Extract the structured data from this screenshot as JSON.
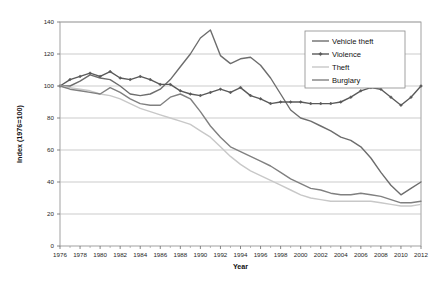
{
  "chart_data": {
    "type": "line",
    "title": "",
    "xlabel": "Year",
    "ylabel": "Index (1976=100)",
    "xlim": [
      1976,
      2012
    ],
    "ylim": [
      0,
      140
    ],
    "ytick_step": 20,
    "xtick_step": 2,
    "grid": true,
    "legend_position": "top-right",
    "yticks": [
      0,
      20,
      40,
      60,
      80,
      100,
      120,
      140
    ],
    "xticks": [
      1976,
      1978,
      1980,
      1982,
      1984,
      1986,
      1988,
      1990,
      1992,
      1994,
      1996,
      1998,
      2000,
      2002,
      2004,
      2006,
      2008,
      2010,
      2012
    ],
    "x": [
      1976,
      1977,
      1978,
      1979,
      1980,
      1981,
      1982,
      1983,
      1984,
      1985,
      1986,
      1987,
      1988,
      1989,
      1990,
      1991,
      1992,
      1993,
      1994,
      1995,
      1996,
      1997,
      1998,
      1999,
      2000,
      2001,
      2002,
      2003,
      2004,
      2005,
      2006,
      2007,
      2008,
      2009,
      2010,
      2011,
      2012
    ],
    "series": [
      {
        "name": "Vehicle theft",
        "color": "#6d6d6d",
        "marker": "none",
        "values": [
          100,
          100,
          103,
          107,
          105,
          104,
          100,
          95,
          94,
          95,
          98,
          104,
          112,
          120,
          130,
          135,
          119,
          114,
          117,
          118,
          113,
          105,
          95,
          85,
          80,
          78,
          75,
          72,
          68,
          66,
          62,
          55,
          46,
          38,
          32,
          36,
          40
        ]
      },
      {
        "name": "Violence",
        "color": "#5a5a5a",
        "marker": "diamond",
        "values": [
          100,
          104,
          106,
          108,
          106,
          109,
          105,
          104,
          106,
          104,
          101,
          101,
          97,
          95,
          94,
          96,
          98,
          96,
          99,
          94,
          92,
          89,
          90,
          90,
          90,
          89,
          89,
          89,
          90,
          93,
          97,
          99,
          98,
          93,
          88,
          93,
          100
        ]
      },
      {
        "name": "Theft",
        "color": "#c8c8c8",
        "marker": "none",
        "values": [
          100,
          99,
          98,
          97,
          95,
          94,
          92,
          89,
          86,
          84,
          82,
          80,
          78,
          76,
          72,
          68,
          62,
          56,
          51,
          47,
          44,
          41,
          38,
          35,
          32,
          30,
          29,
          28,
          28,
          28,
          28,
          28,
          27,
          26,
          25,
          25,
          26
        ]
      },
      {
        "name": "Burglary",
        "color": "#808080",
        "marker": "none",
        "values": [
          100,
          98,
          97,
          96,
          95,
          99,
          96,
          92,
          89,
          88,
          88,
          93,
          95,
          92,
          84,
          75,
          68,
          62,
          59,
          56,
          53,
          50,
          46,
          42,
          39,
          36,
          35,
          33,
          32,
          32,
          33,
          32,
          31,
          29,
          27,
          27,
          28
        ]
      }
    ]
  },
  "legend": {
    "entries": [
      {
        "label": "Vehicle theft"
      },
      {
        "label": "Violence"
      },
      {
        "label": "Theft"
      },
      {
        "label": "Burglary"
      }
    ]
  },
  "axes": {
    "x_title": "Year",
    "y_title": "Index (1976=100)"
  }
}
